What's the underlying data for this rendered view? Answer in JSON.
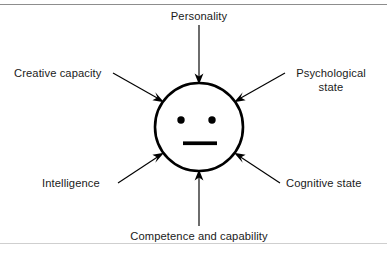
{
  "diagram": {
    "canvas": {
      "width": 387,
      "height": 258,
      "background": "#ffffff"
    },
    "center_node": {
      "name": "person-face",
      "shape": "circle",
      "cx": 199,
      "cy": 127,
      "r": 44,
      "stroke": "#000000",
      "fill": "#ffffff",
      "features": {
        "left_eye": {
          "cx": 181,
          "cy": 120,
          "r": 3.6
        },
        "right_eye": {
          "cx": 212,
          "cy": 120,
          "r": 3.6
        },
        "mouth": {
          "x": 183,
          "y": 141.5,
          "width": 34,
          "height": 3.6
        }
      }
    },
    "rules": {
      "top": {
        "y": 4,
        "color": "#8d8d8d"
      },
      "bottom": {
        "y": 243,
        "color": "#cfcfcf"
      }
    },
    "labels": {
      "personality": "Personality",
      "creative_capacity": "Creative capacity",
      "psychological_state_line1": "Psychological",
      "psychological_state_line2": "state",
      "intelligence": "Intelligence",
      "cognitive_state": "Cognitive state",
      "competence": "Competence and capability"
    },
    "arrows": [
      {
        "name": "arrow-personality",
        "from_label": "Personality",
        "direction": "down",
        "x1": 199,
        "y1": 25,
        "x2": 199,
        "y2": 81,
        "head": "199,84 195.2,74.8 199,77.2 202.8,74.8"
      },
      {
        "name": "arrow-creative-capacity",
        "from_label": "Creative capacity",
        "direction": "down-right",
        "x1": 113,
        "y1": 73,
        "x2": 159.5,
        "y2": 99.5,
        "head": "163,101.8 153.2,99.6 157.1,97.8 155.6,93.7"
      },
      {
        "name": "arrow-psychological-state",
        "from_label": "Psychological state",
        "direction": "down-left",
        "x1": 285,
        "y1": 73,
        "x2": 238.5,
        "y2": 99.5,
        "head": "235,101.8 242.4,93.7 240.9,97.8 244.8,99.6"
      },
      {
        "name": "arrow-intelligence",
        "from_label": "Intelligence",
        "direction": "up-right",
        "x1": 118,
        "y1": 183,
        "x2": 159.5,
        "y2": 155.5,
        "head": "163,153.2 155.6,161.3 157.1,157.2 153.2,155.4"
      },
      {
        "name": "arrow-cognitive-state",
        "from_label": "Cognitive state",
        "direction": "up-left",
        "x1": 280,
        "y1": 183,
        "x2": 238.5,
        "y2": 155.5,
        "head": "235,153.2 244.8,155.4 240.9,157.2 242.4,161.3"
      },
      {
        "name": "arrow-competence",
        "from_label": "Competence and capability",
        "direction": "up",
        "x1": 199,
        "y1": 226,
        "x2": 199,
        "y2": 173,
        "head": "199,170 202.8,179.2 199,176.8 195.2,179.2"
      }
    ],
    "label_positions": {
      "personality": {
        "x": 199,
        "y": 20,
        "anchor": "middle"
      },
      "creative_capacity": {
        "x": 14,
        "y": 77,
        "anchor": "start"
      },
      "psychological_state_line1": {
        "x": 331,
        "y": 77,
        "anchor": "middle"
      },
      "psychological_state_line2": {
        "x": 331,
        "y": 91,
        "anchor": "middle"
      },
      "intelligence": {
        "x": 42,
        "y": 187,
        "anchor": "start"
      },
      "cognitive_state": {
        "x": 286,
        "y": 187,
        "anchor": "start"
      },
      "competence": {
        "x": 199,
        "y": 240,
        "anchor": "middle"
      }
    }
  }
}
